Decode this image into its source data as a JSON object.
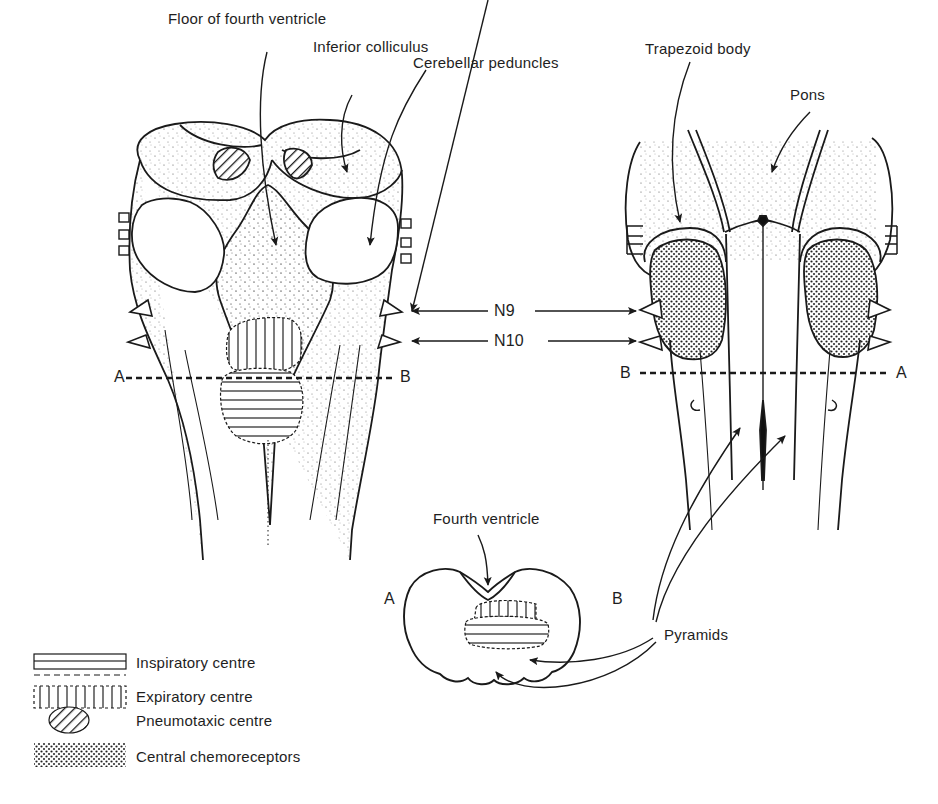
{
  "diagram": {
    "views": {
      "dorsal": {
        "labels": {
          "floor_of_fourth_ventricle": "Floor of fourth ventricle",
          "inferior_colliculus": "Inferior colliculus",
          "cerebellar_peduncles": "Cerebellar peduncles"
        },
        "section_line": {
          "left": "A",
          "right": "B"
        }
      },
      "ventral": {
        "labels": {
          "trapezoid_body": "Trapezoid body",
          "pons": "Pons"
        },
        "section_line": {
          "left": "B",
          "right": "A"
        }
      },
      "cross_section": {
        "labels": {
          "fourth_ventricle": "Fourth ventricle"
        },
        "side_left": "A",
        "side_right": "B"
      }
    },
    "nerves": {
      "n9": "N9",
      "n10": "N10"
    },
    "pyramids": "Pyramids",
    "legend": [
      {
        "pattern": "horizontal-lines",
        "label": "Inspiratory centre"
      },
      {
        "pattern": "vertical-lines",
        "label": "Expiratory centre"
      },
      {
        "pattern": "diagonal-hatch",
        "label": "Pneumotaxic centre"
      },
      {
        "pattern": "stipple-dots",
        "label": "Central chemoreceptors"
      }
    ],
    "colors": {
      "ink": "#1a1a1a",
      "paper": "#ffffff"
    }
  }
}
